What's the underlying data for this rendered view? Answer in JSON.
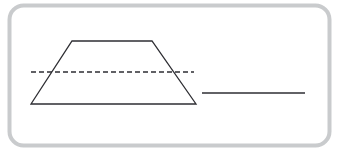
{
  "figure": {
    "width": 339,
    "height": 153,
    "background_color": "#ffffff"
  },
  "frame": {
    "name": "rounded-border-frame",
    "x": 9.5,
    "y": 5.5,
    "width": 320,
    "height": 140,
    "corner_radius": 14,
    "stroke_color": "#c9cbcd",
    "stroke_width": 4,
    "fill": "none"
  },
  "shapes": {
    "trapezoid": {
      "label": "trapezoid",
      "points": "31,104 72,41 152,41 196,104",
      "stroke_color": "#2e2e33",
      "stroke_width": 1.3,
      "fill": "none",
      "vertices": {
        "bottom_left": [
          31,
          104
        ],
        "top_left": [
          72,
          41
        ],
        "top_right": [
          152,
          41
        ],
        "bottom_right": [
          196,
          104
        ]
      }
    },
    "dashed_midline": {
      "label": "dashed-midline",
      "x1": 31,
      "y1": 72,
      "x2": 194,
      "y2": 72,
      "stroke_color": "#2e2e33",
      "stroke_width": 1.5,
      "dash_pattern": "5 3"
    },
    "solid_segment": {
      "label": "solid-line-segment",
      "x1": 202,
      "y1": 93,
      "x2": 305,
      "y2": 93,
      "stroke_color": "#2e2e33",
      "stroke_width": 1.5
    }
  }
}
